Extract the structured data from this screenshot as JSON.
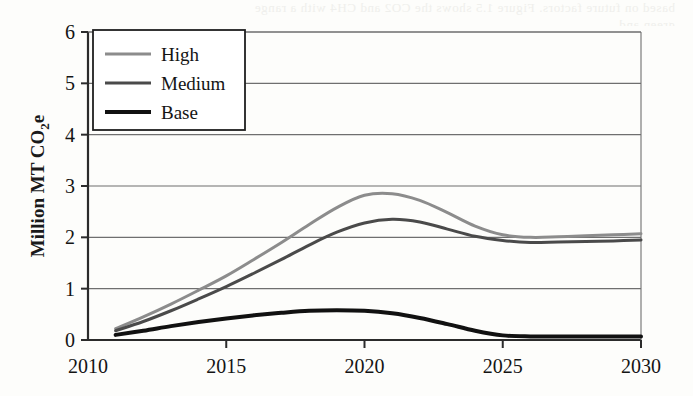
{
  "figure": {
    "background_color": "#fdfdfb",
    "bleed_through_text_line1": "based on future factors. Figure 1.5 shows the CO2 and CH4 with a range",
    "bleed_through_text_line2": "green and"
  },
  "chart_data": {
    "type": "line",
    "title": "",
    "subtitle": "",
    "xlabel": "",
    "ylabel": "Million MT CO2e",
    "ylabel_display": "Million MT CO",
    "ylabel_subscript": "2",
    "ylabel_suffix": "e",
    "xlim": [
      2010,
      2030
    ],
    "ylim": [
      0,
      6
    ],
    "xticks": [
      2010,
      2015,
      2020,
      2025,
      2030
    ],
    "xtick_labels": [
      "2010",
      "2015",
      "2020",
      "2025",
      "2030"
    ],
    "yticks": [
      0,
      1,
      2,
      3,
      4,
      5,
      6
    ],
    "ytick_labels": [
      "0",
      "1",
      "2",
      "3",
      "4",
      "5",
      "6"
    ],
    "grid": "horizontal",
    "grid_color": "#6f6f6f",
    "legend_position": "top-left",
    "x": [
      2011,
      2012,
      2013,
      2014,
      2015,
      2016,
      2017,
      2018,
      2019,
      2020,
      2021,
      2022,
      2023,
      2024,
      2025,
      2026,
      2027,
      2028,
      2029,
      2030
    ],
    "series": [
      {
        "name": "High",
        "color": "#8c8c8c",
        "width": 3.0,
        "values": [
          0.22,
          0.45,
          0.7,
          0.97,
          1.25,
          1.57,
          1.9,
          2.25,
          2.58,
          2.82,
          2.85,
          2.72,
          2.48,
          2.22,
          2.05,
          2.0,
          2.01,
          2.03,
          2.05,
          2.07
        ]
      },
      {
        "name": "Medium",
        "color": "#4a4a4a",
        "width": 3.0,
        "values": [
          0.18,
          0.36,
          0.57,
          0.8,
          1.04,
          1.3,
          1.57,
          1.85,
          2.1,
          2.28,
          2.35,
          2.3,
          2.16,
          2.02,
          1.94,
          1.9,
          1.91,
          1.92,
          1.93,
          1.95
        ]
      },
      {
        "name": "Base",
        "color": "#111111",
        "width": 4.0,
        "values": [
          0.1,
          0.18,
          0.27,
          0.35,
          0.42,
          0.48,
          0.53,
          0.57,
          0.58,
          0.57,
          0.52,
          0.43,
          0.31,
          0.18,
          0.09,
          0.07,
          0.07,
          0.07,
          0.07,
          0.07
        ]
      }
    ]
  },
  "legend": {
    "items": [
      {
        "label": "High",
        "color": "#8c8c8c"
      },
      {
        "label": "Medium",
        "color": "#4a4a4a"
      },
      {
        "label": "Base",
        "color": "#111111"
      }
    ]
  }
}
